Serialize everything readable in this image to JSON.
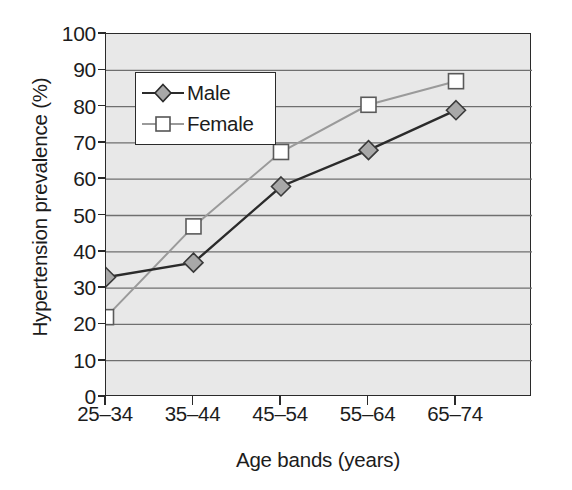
{
  "chart_data": {
    "type": "line",
    "title": "",
    "xlabel": "Age bands (years)",
    "ylabel": "Hypertension prevalence (%)",
    "categories": [
      "25–34",
      "35–44",
      "45–54",
      "55–64",
      "65–74"
    ],
    "ylim": [
      0,
      100
    ],
    "yticks": [
      0,
      10,
      20,
      30,
      40,
      50,
      60,
      70,
      80,
      90,
      100
    ],
    "ytick_labels": [
      "0",
      "10",
      "20",
      "30",
      "40",
      "50",
      "60",
      "70",
      "80",
      "90",
      "100"
    ],
    "grid": "horizontal",
    "legend_position": "top-left-inside",
    "series": [
      {
        "name": "Male",
        "values": [
          33,
          37,
          58,
          68,
          79
        ],
        "marker": "diamond",
        "marker_fill": "#a8a8a8",
        "line_color": "#2b2b2b"
      },
      {
        "name": "Female",
        "values": [
          22,
          47,
          67.5,
          80.5,
          87
        ],
        "marker": "square",
        "marker_fill": "#ffffff",
        "line_color": "#9a9a9a"
      }
    ]
  },
  "legend": {
    "items": [
      {
        "label": "Male"
      },
      {
        "label": "Female"
      }
    ]
  },
  "colors": {
    "plot_background": "#e8e8e8",
    "axis": "#2a2a2a",
    "gridline": "#6f6f6f",
    "male_line": "#2b2b2b",
    "male_marker": "#a8a8a8",
    "female_line": "#9a9a9a",
    "female_marker": "#ffffff",
    "text": "#1c1c1c"
  }
}
